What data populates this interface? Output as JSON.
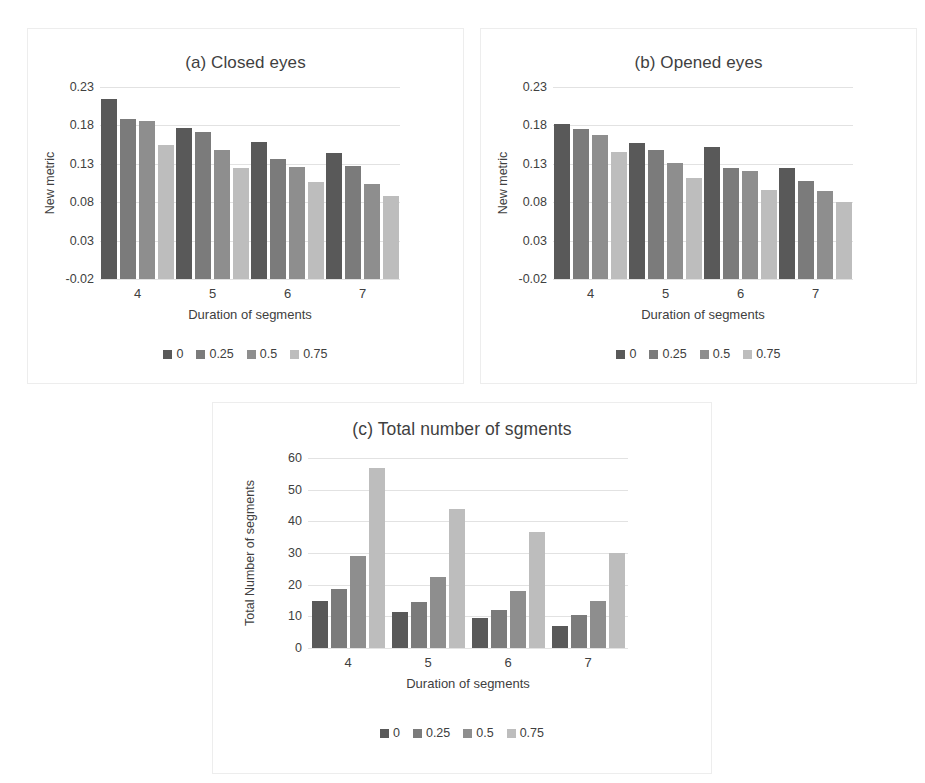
{
  "figure": {
    "background": "#ffffff",
    "panel_border": "#ededed"
  },
  "series_colors": [
    "#595959",
    "#7b7b7b",
    "#8e8e8e",
    "#bdbdbd"
  ],
  "legend_labels": [
    "0",
    "0.25",
    "0.5",
    "0.75"
  ],
  "chart_data": [
    {
      "id": "a",
      "type": "bar",
      "title": "(a) Closed eyes",
      "xlabel": "Duration of segments",
      "ylabel": "New metric",
      "categories": [
        "4",
        "5",
        "6",
        "7"
      ],
      "yticks": [
        "-0.02",
        "0.03",
        "0.08",
        "0.13",
        "0.18",
        "0.23"
      ],
      "ytick_values": [
        -0.02,
        0.03,
        0.08,
        0.13,
        0.18,
        0.23
      ],
      "ylim": [
        -0.02,
        0.23
      ],
      "grid": true,
      "legend_position": "bottom",
      "series": [
        {
          "name": "0",
          "values": [
            0.215,
            0.177,
            0.158,
            0.144
          ]
        },
        {
          "name": "0.25",
          "values": [
            0.189,
            0.171,
            0.136,
            0.127
          ]
        },
        {
          "name": "0.5",
          "values": [
            0.186,
            0.148,
            0.126,
            0.104
          ]
        },
        {
          "name": "0.75",
          "values": [
            0.155,
            0.124,
            0.106,
            0.088
          ]
        }
      ]
    },
    {
      "id": "b",
      "type": "bar",
      "title": "(b) Opened eyes",
      "xlabel": "Duration of segments",
      "ylabel": "New metric",
      "categories": [
        "4",
        "5",
        "6",
        "7"
      ],
      "yticks": [
        "-0.02",
        "0.03",
        "0.08",
        "0.13",
        "0.18",
        "0.23"
      ],
      "ytick_values": [
        -0.02,
        0.03,
        0.08,
        0.13,
        0.18,
        0.23
      ],
      "ylim": [
        -0.02,
        0.23
      ],
      "grid": true,
      "legend_position": "bottom",
      "series": [
        {
          "name": "0",
          "values": [
            0.182,
            0.157,
            0.152,
            0.125
          ]
        },
        {
          "name": "0.25",
          "values": [
            0.175,
            0.148,
            0.124,
            0.107
          ]
        },
        {
          "name": "0.5",
          "values": [
            0.168,
            0.131,
            0.12,
            0.094
          ]
        },
        {
          "name": "0.75",
          "values": [
            0.146,
            0.112,
            0.096,
            0.08
          ]
        }
      ]
    },
    {
      "id": "c",
      "type": "bar",
      "title": "(c) Total number of sgments",
      "xlabel": "Duration of segments",
      "ylabel": "Total Number of segments",
      "categories": [
        "4",
        "5",
        "6",
        "7"
      ],
      "yticks": [
        "0",
        "10",
        "20",
        "30",
        "40",
        "50",
        "60"
      ],
      "ytick_values": [
        0,
        10,
        20,
        30,
        40,
        50,
        60
      ],
      "ylim": [
        0,
        60
      ],
      "grid": true,
      "legend_position": "bottom",
      "series": [
        {
          "name": "0",
          "values": [
            15,
            11.5,
            9.5,
            7
          ]
        },
        {
          "name": "0.25",
          "values": [
            18.5,
            14.5,
            12,
            10.5
          ]
        },
        {
          "name": "0.5",
          "values": [
            29,
            22.5,
            18,
            15
          ]
        },
        {
          "name": "0.75",
          "values": [
            57,
            44,
            36.5,
            30
          ]
        }
      ]
    }
  ]
}
